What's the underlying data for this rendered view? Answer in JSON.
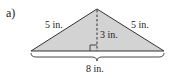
{
  "figure": {
    "part_label": "a)",
    "shape": "isosceles triangle",
    "labels": {
      "left_side": "5 in.",
      "right_side": "5 in.",
      "height": "3 in.",
      "base": "8 in."
    },
    "colors": {
      "fill": "#d3d3d3",
      "stroke": "#333333"
    }
  }
}
